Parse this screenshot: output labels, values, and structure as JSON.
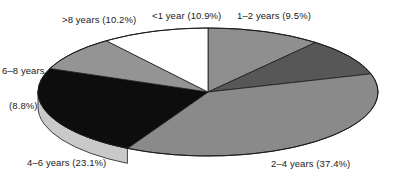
{
  "chart_data": {
    "type": "pie",
    "title": "",
    "subtitle": "",
    "xlabel": "",
    "ylabel": "",
    "legend_position": "none",
    "grid": false,
    "three_d": true,
    "start_angle_deg": 0,
    "direction": "clockwise",
    "categories": [
      "<1 year",
      "1–2 years",
      "2–4 years",
      "4–6 years",
      "6–8 years",
      ">8 years"
    ],
    "values": [
      10.9,
      9.5,
      37.4,
      23.1,
      8.8,
      10.2
    ],
    "unit": "%",
    "slices": [
      {
        "category": "<1 year",
        "value": 10.9,
        "label": "<1 year (10.9%)",
        "color": "#8f8f8f",
        "side_color": "#6e6e6e"
      },
      {
        "category": "1–2 years",
        "value": 9.5,
        "label": "1–2 years (9.5%)",
        "color": "#575757",
        "side_color": "#3f3f3f"
      },
      {
        "category": "2–4 years",
        "value": 37.4,
        "label": "2–4 years (37.4%)",
        "color": "#8a8a8a",
        "side_color": "#c9c9c9"
      },
      {
        "category": "4–6 years",
        "value": 23.1,
        "label": "4–6 years (23.1%)",
        "color": "#0d0d0d",
        "side_color": "#c9c9c9"
      },
      {
        "category": "6–8 years",
        "value": 8.8,
        "label_line1": "6–8 years",
        "label_line2": "(8.8%)",
        "label": "6–8 years (8.8%)",
        "color": "#949494",
        "side_color": "#c9c9c9"
      },
      {
        "category": ">8 years",
        "value": 10.2,
        "label": ">8 years (10.2%)",
        "color": "#ffffff",
        "side_color": "#dcdcdc"
      }
    ],
    "colors": {
      "background": "#ffffff",
      "outline": "#1a1a1a",
      "rim": "#c9c9c9",
      "rim_shadow": "#e2e2e2",
      "label_text": "#1a1a1a"
    },
    "geometry": {
      "center_x": 208,
      "center_y": 92,
      "radius_x": 170,
      "radius_y": 64,
      "depth": 15
    }
  }
}
